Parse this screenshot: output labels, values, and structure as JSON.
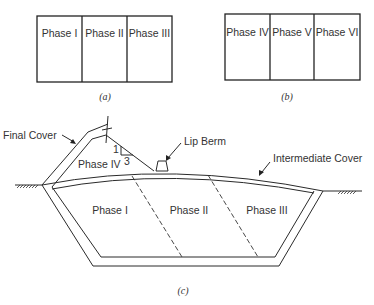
{
  "figure_a": {
    "phases": [
      "Phase I",
      "Phase II",
      "Phase III"
    ],
    "caption": "(a)"
  },
  "figure_b": {
    "phases": [
      "Phase IV",
      "Phase V",
      "Phase VI"
    ],
    "caption": "(b)"
  },
  "figure_c": {
    "labels": {
      "final_cover": "Final Cover",
      "lip_berm": "Lip Berm",
      "intermediate_cover": "Intermediate Cover",
      "phase_iv": "Phase IV",
      "slope_rise": "1",
      "slope_run": "3"
    },
    "phases": [
      "Phase I",
      "Phase II",
      "Phase III"
    ],
    "caption": "(c)"
  }
}
